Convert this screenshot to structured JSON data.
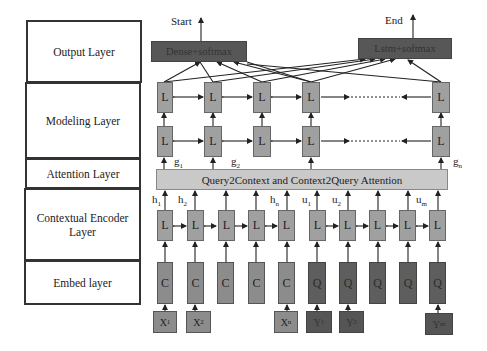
{
  "left_layers": [
    {
      "label": "Output Layer"
    },
    {
      "label": "Modeling Layer"
    },
    {
      "label": "Attention Layer"
    },
    {
      "label": "Contextual Encoder Layer"
    },
    {
      "label": "Embed layer"
    }
  ],
  "output": {
    "start_label": "Start",
    "end_label": "End",
    "start_box": "Dense+softmax",
    "end_box": "Lstm+softmax"
  },
  "modeling": {
    "cell_label": "L",
    "g_labels": [
      "g",
      "g",
      "g"
    ],
    "g_subs": [
      "1",
      "2",
      "n"
    ]
  },
  "attention": {
    "label": "Query2Context and Context2Query Attention"
  },
  "contextual": {
    "cell_label": "L",
    "h_labels": [
      "h",
      "h",
      "h"
    ],
    "h_subs": [
      "1",
      "2",
      "n"
    ],
    "u_labels": [
      "u",
      "u",
      "u"
    ],
    "u_subs": [
      "1",
      "2",
      "m"
    ]
  },
  "embed": {
    "context_label": "C",
    "query_label": "Q",
    "x_inputs": [
      {
        "base": "X",
        "sub": "1"
      },
      {
        "base": "X",
        "sub": "2"
      },
      {
        "base": "X",
        "sub": "n"
      }
    ],
    "y_inputs": [
      {
        "base": "Y",
        "sub": "1"
      },
      {
        "base": "Y",
        "sub": "2"
      },
      {
        "base": "Y",
        "sub": "m"
      }
    ]
  },
  "colors": {
    "l_cell": "#a0a0a0",
    "c_cell": "#8c8c8c",
    "q_cell": "#5e5e5e",
    "attention_bar": "#c9c9c9",
    "output_box": "#575757"
  }
}
